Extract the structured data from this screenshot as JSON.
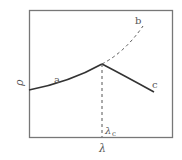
{
  "diagram": {
    "y_axis_label": "ρ",
    "x_axis_label": "λ",
    "critical_label": "λ",
    "critical_subscript": "c",
    "curves": [
      {
        "id": "a",
        "label": "a",
        "style": "solid"
      },
      {
        "id": "b",
        "label": "b",
        "style": "dashed"
      },
      {
        "id": "c",
        "label": "c",
        "style": "solid"
      }
    ]
  }
}
